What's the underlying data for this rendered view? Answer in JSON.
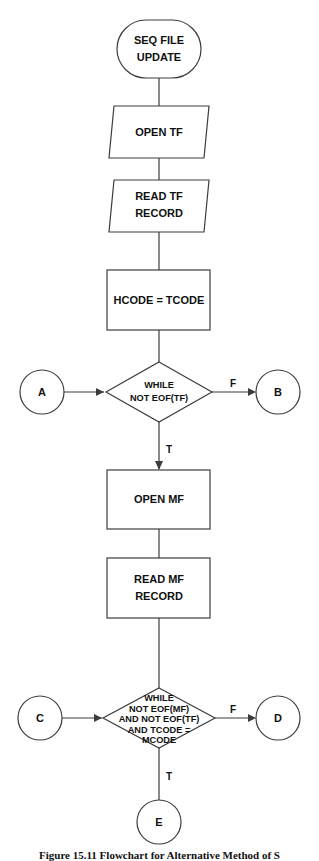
{
  "figure": {
    "caption": "Figure 15.11   Flowchart for Alternative Method of S",
    "background_color": "#ffffff",
    "stroke_color": "#3c3c3c",
    "text_color": "#111111"
  },
  "nodes": {
    "terminal_start": {
      "shape": "terminator",
      "lines": [
        "SEQ FILE",
        "UPDATE"
      ]
    },
    "open_tf": {
      "shape": "parallelogram",
      "lines": [
        "OPEN TF"
      ]
    },
    "read_tf": {
      "shape": "parallelogram",
      "lines": [
        "READ TF",
        "RECORD"
      ]
    },
    "hcode_assign": {
      "shape": "process",
      "lines": [
        "HCODE = TCODE"
      ]
    },
    "decision_tf": {
      "shape": "decision",
      "lines": [
        "WHILE",
        "NOT EOF(TF)"
      ]
    },
    "open_mf": {
      "shape": "process",
      "lines": [
        "OPEN MF"
      ]
    },
    "read_mf": {
      "shape": "process",
      "lines": [
        "READ MF",
        "RECORD"
      ]
    },
    "decision_mf": {
      "shape": "decision",
      "lines": [
        "WHILE",
        "NOT EOF(MF)",
        "AND NOT EOF(TF)",
        "AND TCODE =",
        "MCODE"
      ]
    }
  },
  "connectors": {
    "a": {
      "label": "A"
    },
    "b": {
      "label": "B"
    },
    "c": {
      "label": "C"
    },
    "d": {
      "label": "D"
    },
    "e": {
      "label": "E"
    }
  },
  "branch_labels": {
    "decision_tf_false": "F",
    "decision_tf_true": "T",
    "decision_mf_false": "F",
    "decision_mf_true": "T"
  },
  "icons": {
    "arrow": "arrow-head-icon"
  }
}
